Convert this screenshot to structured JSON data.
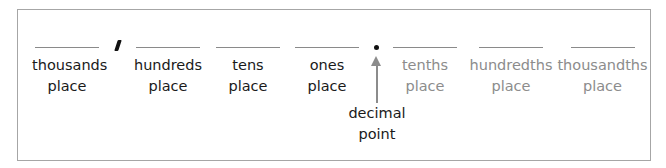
{
  "diagram": {
    "places": [
      {
        "name": "thousands",
        "suffix": "place",
        "side": "whole"
      },
      {
        "name": "hundreds",
        "suffix": "place",
        "side": "whole"
      },
      {
        "name": "tens",
        "suffix": "place",
        "side": "whole"
      },
      {
        "name": "ones",
        "suffix": "place",
        "side": "whole"
      },
      {
        "name": "tenths",
        "suffix": "place",
        "side": "fraction"
      },
      {
        "name": "hundredths",
        "suffix": "place",
        "side": "fraction"
      },
      {
        "name": "thousandths",
        "suffix": "place",
        "side": "fraction"
      }
    ],
    "separators": {
      "comma": ",",
      "decimal": "."
    },
    "decimal_label": {
      "line1": "decimal",
      "line2": "point"
    },
    "colors": {
      "whole_text": "#1a1a1a",
      "fraction_text": "#8c8c8c",
      "arrow": "#8c8c8c",
      "border": "#a6a6a6"
    }
  }
}
